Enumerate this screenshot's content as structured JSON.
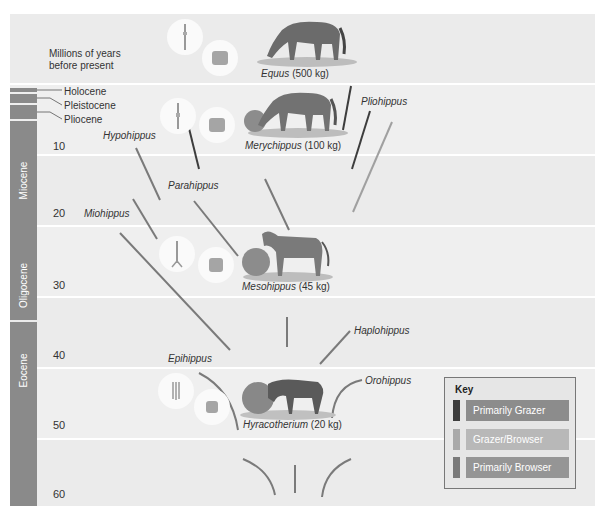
{
  "header": {
    "axis_title": "Millions of years before present"
  },
  "eras": {
    "holocene": "Holocene",
    "pleistocene": "Pleistocene",
    "pliocene": "Pliocene",
    "miocene": "Miocene",
    "oligocene": "Oligocene",
    "eocene": "Eocene"
  },
  "ticks": [
    "10",
    "20",
    "30",
    "40",
    "50",
    "60"
  ],
  "genera": {
    "hypohippus": "Hypohippus",
    "parahippus": "Parahippus",
    "miohippus": "Miohippus",
    "pliohippus": "Pliohippus",
    "haplohippus": "Haplohippus",
    "epihippus": "Epihippus",
    "orohippus": "Orohippus"
  },
  "specimens": [
    {
      "name": "Equus",
      "mass": "(500 kg)"
    },
    {
      "name": "Merychippus",
      "mass": "(100 kg)"
    },
    {
      "name": "Mesohippus",
      "mass": "(45 kg)"
    },
    {
      "name": "Hyracotherium",
      "mass": "(20 kg)"
    }
  ],
  "key": {
    "title": "Key",
    "items": [
      {
        "label": "Primarily Grazer",
        "swatch": "#3d3d3d",
        "bar": "#8c8c8c"
      },
      {
        "label": "Grazer/Browser",
        "swatch": "#a9a9a9",
        "bar": "#b8b8b8"
      },
      {
        "label": "Primarily Browser",
        "swatch": "#7a7a7a",
        "bar": "#959595"
      }
    ]
  },
  "colors": {
    "grazer": "#3d3d3d",
    "grazer_browser": "#a0a0a0",
    "browser": "#7a7a7a"
  }
}
